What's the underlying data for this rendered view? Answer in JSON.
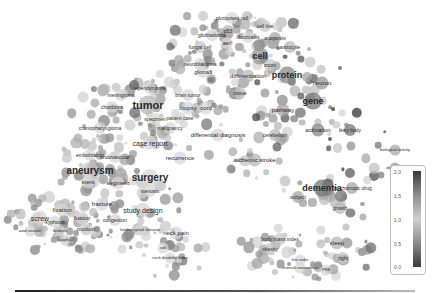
{
  "chart_data": {
    "type": "scatter",
    "title": "",
    "xlabel": "",
    "ylabel": "",
    "grid": false,
    "legend_position": "right-bottom colorbar",
    "colorbar": {
      "ticks": [
        "2.0",
        "1.5",
        "1.0",
        "0.5",
        "0.0"
      ],
      "min": 0.0,
      "max": 2.0
    },
    "points": [
      {
        "label": "pluripotent cell",
        "x": 232,
        "y": 18,
        "size": 5,
        "v": 1.0
      },
      {
        "label": "cell line",
        "x": 265,
        "y": 26,
        "size": 5,
        "v": 1.1
      },
      {
        "label": "glioblastoma",
        "x": 212,
        "y": 35,
        "size": 5,
        "v": 1.0
      },
      {
        "label": "p53",
        "x": 228,
        "y": 31,
        "size": 5,
        "v": 1.2
      },
      {
        "label": "fibroblasts",
        "x": 248,
        "y": 37,
        "size": 5,
        "v": 1.0
      },
      {
        "label": "apoptosis",
        "x": 275,
        "y": 38,
        "size": 5,
        "v": 1.3
      },
      {
        "label": "fungal cell",
        "x": 200,
        "y": 47,
        "size": 5,
        "v": 0.9
      },
      {
        "label": "aerf",
        "x": 227,
        "y": 43,
        "size": 5,
        "v": 1.0
      },
      {
        "label": "astrocyte",
        "x": 290,
        "y": 47,
        "size": 5,
        "v": 1.2
      },
      {
        "label": "cell",
        "x": 260,
        "y": 56,
        "size": 9,
        "v": 1.4
      },
      {
        "label": "neuroblastoma",
        "x": 200,
        "y": 64,
        "size": 5,
        "v": 1.0
      },
      {
        "label": "glioma3",
        "x": 203,
        "y": 72,
        "size": 5,
        "v": 1.0
      },
      {
        "label": "zoom",
        "x": 270,
        "y": 65,
        "size": 5,
        "v": 1.1
      },
      {
        "label": "differentiation",
        "x": 248,
        "y": 76,
        "size": 6,
        "v": 1.2
      },
      {
        "label": "protein",
        "x": 287,
        "y": 75,
        "size": 9,
        "v": 1.5
      },
      {
        "label": "neuron",
        "x": 322,
        "y": 83,
        "size": 6,
        "v": 1.4
      },
      {
        "label": "ependymoma",
        "x": 150,
        "y": 88,
        "size": 5,
        "v": 1.0
      },
      {
        "label": "meningioma",
        "x": 121,
        "y": 95,
        "size": 5,
        "v": 1.0
      },
      {
        "label": "brain tumor",
        "x": 188,
        "y": 95,
        "size": 5,
        "v": 1.0
      },
      {
        "label": "tissue",
        "x": 240,
        "y": 93,
        "size": 5,
        "v": 1.1
      },
      {
        "label": "gene",
        "x": 313,
        "y": 101,
        "size": 9,
        "v": 1.6
      },
      {
        "label": "tumor",
        "x": 148,
        "y": 105,
        "size": 11,
        "v": 1.2
      },
      {
        "label": "biopsy",
        "x": 188,
        "y": 108,
        "size": 6,
        "v": 1.0
      },
      {
        "label": "cord",
        "x": 206,
        "y": 108,
        "size": 6,
        "v": 1.0
      },
      {
        "label": "pathway",
        "x": 283,
        "y": 110,
        "size": 6,
        "v": 1.3
      },
      {
        "label": "chordoma",
        "x": 112,
        "y": 107,
        "size": 5,
        "v": 1.0
      },
      {
        "label": "specimen",
        "x": 155,
        "y": 119,
        "size": 5,
        "v": 1.0
      },
      {
        "label": "patient case",
        "x": 180,
        "y": 118,
        "size": 5,
        "v": 1.0
      },
      {
        "label": "craniopharyngioma",
        "x": 100,
        "y": 128,
        "size": 5,
        "v": 1.0
      },
      {
        "label": "malignancy",
        "x": 170,
        "y": 128,
        "size": 5,
        "v": 1.0
      },
      {
        "label": "differential diagnosis",
        "x": 218,
        "y": 135,
        "size": 6,
        "v": 1.0
      },
      {
        "label": "cerebellum",
        "x": 275,
        "y": 135,
        "size": 5,
        "v": 1.2
      },
      {
        "label": "activation",
        "x": 318,
        "y": 130,
        "size": 6,
        "v": 1.5
      },
      {
        "label": "lewy body",
        "x": 350,
        "y": 130,
        "size": 5,
        "v": 1.6
      },
      {
        "label": "case report",
        "x": 150,
        "y": 143,
        "size": 7,
        "v": 1.0
      },
      {
        "label": "embolization",
        "x": 90,
        "y": 155,
        "size": 5,
        "v": 1.0
      },
      {
        "label": "endovascular",
        "x": 115,
        "y": 157,
        "size": 5,
        "v": 1.0
      },
      {
        "label": "recurrence",
        "x": 180,
        "y": 158,
        "size": 6,
        "v": 1.0
      },
      {
        "label": "ischemic stroke",
        "x": 255,
        "y": 160,
        "size": 6,
        "v": 1.2
      },
      {
        "label": "aneurysm",
        "x": 90,
        "y": 171,
        "size": 10,
        "v": 1.1
      },
      {
        "label": "surgery",
        "x": 150,
        "y": 178,
        "size": 10,
        "v": 1.0
      },
      {
        "label": "dementia",
        "x": 322,
        "y": 188,
        "size": 9,
        "v": 1.6
      },
      {
        "label": "psychotropic drug",
        "x": 352,
        "y": 188,
        "size": 5,
        "v": 1.3
      },
      {
        "label": "stent",
        "x": 88,
        "y": 182,
        "size": 6,
        "v": 1.0
      },
      {
        "label": "segment",
        "x": 118,
        "y": 183,
        "size": 6,
        "v": 1.0
      },
      {
        "label": "stenosis",
        "x": 150,
        "y": 191,
        "size": 5,
        "v": 1.0
      },
      {
        "label": "fracture",
        "x": 102,
        "y": 204,
        "size": 6,
        "v": 1.0
      },
      {
        "label": "study design",
        "x": 143,
        "y": 210,
        "size": 7,
        "v": 1.0
      },
      {
        "label": "fixation",
        "x": 62,
        "y": 210,
        "size": 6,
        "v": 1.0
      },
      {
        "label": "screw",
        "x": 40,
        "y": 218,
        "size": 7,
        "v": 1.0
      },
      {
        "label": "fusion",
        "x": 82,
        "y": 218,
        "size": 6,
        "v": 1.0
      },
      {
        "label": "kyphosis",
        "x": 55,
        "y": 222,
        "size": 5,
        "v": 1.0
      },
      {
        "label": "congestion",
        "x": 115,
        "y": 220,
        "size": 5,
        "v": 1.0
      },
      {
        "label": "motion",
        "x": 86,
        "y": 229,
        "size": 6,
        "v": 1.0
      },
      {
        "label": "axial rotation",
        "x": 30,
        "y": 231,
        "size": 4,
        "v": 1.0
      },
      {
        "label": "lordosis",
        "x": 60,
        "y": 231,
        "size": 4,
        "v": 1.0
      },
      {
        "label": "lumbar spinal stenosis",
        "x": 140,
        "y": 230,
        "size": 4,
        "v": 1.0
      },
      {
        "label": "sagittal",
        "x": 65,
        "y": 240,
        "size": 4,
        "v": 1.0
      },
      {
        "label": "odi",
        "x": 163,
        "y": 248,
        "size": 4,
        "v": 1.0
      },
      {
        "label": "neck disability index",
        "x": 170,
        "y": 258,
        "size": 4,
        "v": 1.0
      },
      {
        "label": "neck pain",
        "x": 176,
        "y": 233,
        "size": 6,
        "v": 1.0
      },
      {
        "label": "subject",
        "x": 298,
        "y": 197,
        "size": 5,
        "v": 1.3
      },
      {
        "label": "growth",
        "x": 340,
        "y": 208,
        "size": 5,
        "v": 1.2
      },
      {
        "label": "body mass index",
        "x": 280,
        "y": 239,
        "size": 5,
        "v": 1.1
      },
      {
        "label": "sleep",
        "x": 337,
        "y": 243,
        "size": 6,
        "v": 1.2
      },
      {
        "label": "obesity",
        "x": 270,
        "y": 249,
        "size": 5,
        "v": 1.1
      },
      {
        "label": "first-order",
        "x": 300,
        "y": 260,
        "size": 4,
        "v": 1.0
      },
      {
        "label": "internal consistency",
        "x": 300,
        "y": 268,
        "size": 4,
        "v": 1.0
      },
      {
        "label": "right",
        "x": 343,
        "y": 258,
        "size": 5,
        "v": 1.1
      },
      {
        "label": "PRB",
        "x": 326,
        "y": 270,
        "size": 4,
        "v": 1.0
      },
      {
        "label": "biological activity",
        "x": 395,
        "y": 150,
        "size": 4,
        "v": 1.3
      },
      {
        "label": "dopamine",
        "x": 395,
        "y": 168,
        "size": 4,
        "v": 1.4
      }
    ]
  }
}
